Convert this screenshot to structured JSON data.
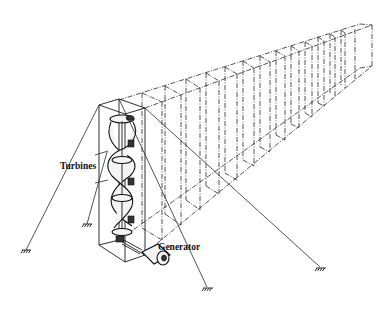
{
  "figure": {
    "type": "perspective line drawing",
    "background": "#ffffff",
    "ink_color": "#1a1a1a"
  },
  "labels": {
    "turbines": "Turbines",
    "generator": "Generator"
  },
  "components": {
    "frame_modules_count": 14,
    "turbine_stages": 3,
    "mooring_lines": 5,
    "ground_anchors": 5
  }
}
